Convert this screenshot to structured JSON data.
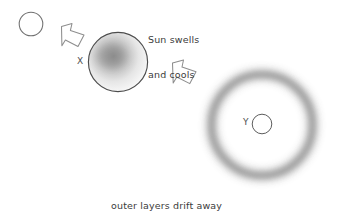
{
  "diagram": {
    "background_color": "#ffffff",
    "text_color": "#3b3b3b",
    "stage_label_color": "#50504f",
    "width": 342,
    "height": 211,
    "annotations": {
      "swell_caption_line1": "Sun swells",
      "swell_caption_line2": "and cools",
      "nebula_caption_line1": "outer layers drift away",
      "nebula_caption_line2": "exposing a white-hot core"
    },
    "markers": {
      "swollen_sun_label": "X",
      "white_dwarf_label": "Y"
    },
    "objects": [
      {
        "name": "present-sun",
        "shape": "circle-outline",
        "cx": 31,
        "cy": 24,
        "r": 12,
        "stroke": "#6d6d6d",
        "fill": "none"
      },
      {
        "name": "swollen-sun",
        "shape": "circle-gradient",
        "cx": 118,
        "cy": 62,
        "r": 30,
        "stroke": "#4a4a4a",
        "fill_center": "#9b9b9b",
        "fill_edge": "#f2f2f2"
      },
      {
        "name": "planetary-nebula-ring",
        "shape": "ring-blurred",
        "cx": 262,
        "cy": 125,
        "r": 51,
        "ring_color": "#9a9a9a"
      },
      {
        "name": "white-dwarf",
        "shape": "circle-outline",
        "cx": 262,
        "cy": 124,
        "r": 10,
        "stroke": "#5a5a5a",
        "fill": "none"
      }
    ],
    "arrows": [
      {
        "name": "arrow-sun-to-swollen",
        "direction": "down-right",
        "stroke": "#8a8a8a",
        "fill": "none"
      },
      {
        "name": "arrow-swollen-to-nebula",
        "direction": "down-right",
        "stroke": "#8a8a8a",
        "fill": "none"
      }
    ]
  }
}
